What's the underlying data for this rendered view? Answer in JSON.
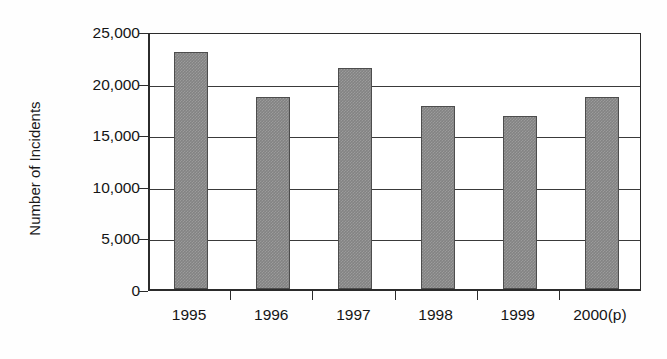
{
  "chart_data": {
    "type": "bar",
    "title": "",
    "subtitle": "",
    "xlabel": "",
    "ylabel": "Number of Incidents",
    "categories": [
      "1995",
      "1996",
      "1997",
      "1998",
      "1999",
      "2000(p)"
    ],
    "values": [
      23000,
      18600,
      21400,
      17700,
      16750,
      18600
    ],
    "series": [
      {
        "name": "Number of Incidents",
        "values": [
          23000,
          18600,
          21400,
          17700,
          16750,
          18600
        ]
      }
    ],
    "ylim": [
      0,
      25000
    ],
    "ytick_values": [
      0,
      5000,
      10000,
      15000,
      20000,
      25000
    ],
    "ytick_labels": [
      "0",
      "5,000",
      "10,000",
      "15,000",
      "20,000",
      "25,000"
    ],
    "grid": "horizontal",
    "legend": "none",
    "bar_color": "#838383",
    "bar_edge_color": "#4d4d4d",
    "axis_color": "#2b2b2b",
    "grid_color": "#3a3a3a",
    "background_color": "#ffffff"
  }
}
